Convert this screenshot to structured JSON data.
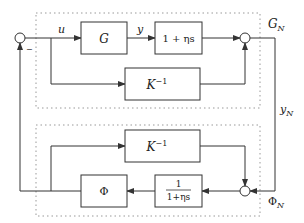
{
  "diagram": {
    "colors": {
      "line": "#333333",
      "dashed": "#999999",
      "text": "#222222"
    },
    "groups": {
      "top": {
        "label": "G",
        "label_sub": "N"
      },
      "bottom": {
        "label": "Φ",
        "label_sub": "N"
      }
    },
    "signals": {
      "u": "u",
      "y": "y",
      "yN": "y",
      "yN_sub": "N",
      "minus": "−"
    },
    "blocks": {
      "G": {
        "label": "G"
      },
      "lead": {
        "label": "1 + ηs"
      },
      "Kinv_top": {
        "base": "K",
        "exp": "−1"
      },
      "Kinv_bottom": {
        "base": "K",
        "exp": "−1"
      },
      "Phi": {
        "label": "Φ"
      },
      "lag": {
        "num": "1",
        "den": "1+ηs"
      }
    },
    "junctions": [
      "input-sum",
      "top-output-sum",
      "bottom-sum"
    ]
  }
}
